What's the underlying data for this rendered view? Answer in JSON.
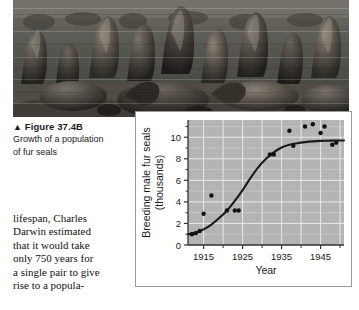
{
  "figure": {
    "photo_alt": "colony-of-fur-seals-photograph",
    "marker": "▲",
    "number_label": "Figure 37.4B",
    "caption_line1": "Growth of a population",
    "caption_line2": "of fur seals"
  },
  "body_text": {
    "lines": [
      "lifespan, Charles",
      "Darwin estimated",
      "that it would take",
      "only 750 years for",
      "a single pair to give",
      "rise to a popula-"
    ]
  },
  "colors": {
    "plot_background": "#b4b4b4",
    "gridline": "#e8e8e8",
    "curve": "#1a1a1a",
    "point": "#111111",
    "panel_border": "#9a9a9a",
    "axis": "#333333",
    "page_background": "#ffffff",
    "text": "#1a1a1a"
  },
  "chart_data": {
    "type": "scatter",
    "title": "",
    "xlabel": "Year",
    "ylabel": "Breeding male fur seals (thousands)",
    "ylabel_line1": "Breeding male fur seals",
    "ylabel_line2": "(thousands)",
    "xlim": [
      1911,
      1951
    ],
    "ylim": [
      0,
      11.6
    ],
    "xticks": [
      1915,
      1925,
      1935,
      1945
    ],
    "xticks_minor": [
      1920,
      1930,
      1940,
      1950
    ],
    "yticks": [
      0,
      2,
      4,
      6,
      8,
      10
    ],
    "xtick_labels": [
      "1915",
      "1925",
      "1935",
      "1945"
    ],
    "ytick_labels": [
      "0",
      "2",
      "4",
      "6",
      "8",
      "10"
    ],
    "grid": true,
    "legend": "none",
    "points": [
      {
        "x": 1912,
        "y": 1.0
      },
      {
        "x": 1913,
        "y": 1.1
      },
      {
        "x": 1914,
        "y": 1.3
      },
      {
        "x": 1915,
        "y": 2.9
      },
      {
        "x": 1917,
        "y": 4.6
      },
      {
        "x": 1921,
        "y": 3.2
      },
      {
        "x": 1923,
        "y": 3.2
      },
      {
        "x": 1924,
        "y": 3.2
      },
      {
        "x": 1932,
        "y": 8.4
      },
      {
        "x": 1933,
        "y": 8.4
      },
      {
        "x": 1937,
        "y": 10.6
      },
      {
        "x": 1938,
        "y": 9.2
      },
      {
        "x": 1941,
        "y": 11.0
      },
      {
        "x": 1943,
        "y": 11.2
      },
      {
        "x": 1945,
        "y": 10.4
      },
      {
        "x": 1946,
        "y": 11.0
      },
      {
        "x": 1948,
        "y": 9.3
      },
      {
        "x": 1949,
        "y": 9.5
      }
    ],
    "fitted_curve": {
      "name": "logistic-growth-curve",
      "carrying_capacity": 9.7,
      "values": [
        {
          "x": 1911,
          "y": 1.0
        },
        {
          "x": 1913,
          "y": 1.15
        },
        {
          "x": 1915,
          "y": 1.45
        },
        {
          "x": 1917,
          "y": 1.9
        },
        {
          "x": 1919,
          "y": 2.5
        },
        {
          "x": 1921,
          "y": 3.2
        },
        {
          "x": 1923,
          "y": 4.1
        },
        {
          "x": 1925,
          "y": 5.1
        },
        {
          "x": 1927,
          "y": 6.2
        },
        {
          "x": 1929,
          "y": 7.2
        },
        {
          "x": 1931,
          "y": 8.0
        },
        {
          "x": 1933,
          "y": 8.6
        },
        {
          "x": 1935,
          "y": 9.05
        },
        {
          "x": 1937,
          "y": 9.3
        },
        {
          "x": 1939,
          "y": 9.45
        },
        {
          "x": 1941,
          "y": 9.55
        },
        {
          "x": 1943,
          "y": 9.62
        },
        {
          "x": 1945,
          "y": 9.66
        },
        {
          "x": 1947,
          "y": 9.68
        },
        {
          "x": 1949,
          "y": 9.7
        },
        {
          "x": 1951,
          "y": 9.7
        }
      ]
    }
  }
}
